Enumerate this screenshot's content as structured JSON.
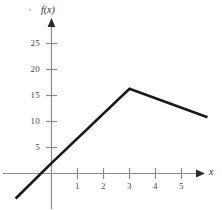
{
  "chart_data": {
    "type": "line",
    "title": "",
    "subtitle": "",
    "xlabel": "x",
    "ylabel": "f(x)",
    "xlim": [
      -1.4,
      6.3
    ],
    "ylim": [
      -1.5,
      29
    ],
    "grid": false,
    "legend": null,
    "x_ticks": [
      1,
      2,
      3,
      4,
      5
    ],
    "x_tick_labels": [
      "1",
      "2",
      "3",
      "4",
      "5"
    ],
    "y_ticks": [
      5,
      10,
      15,
      20,
      25
    ],
    "y_tick_labels": [
      "5",
      "10",
      "15",
      "20",
      "25"
    ],
    "series": [
      {
        "name": "f(x)",
        "x": [
          -1.38,
          0,
          3,
          6.0
        ],
        "values": [
          -4.8,
          2.0,
          16.3,
          10.8
        ],
        "color": "#1a1a1a",
        "linewidth": 2.6,
        "description": "piecewise linear: rising segment from lower left through y-intercept 2 to peak (3, 16.3), then falling to (6, 10.8)"
      }
    ],
    "annotations": [
      {
        "name": "peak-vertex",
        "x": 3,
        "y": 16.3
      },
      {
        "name": "y-intercept",
        "x": 0,
        "y": 2.0
      },
      {
        "name": "x-intercept",
        "x": -0.42,
        "y": 0
      }
    ],
    "axis_style": {
      "axis_color": "#8c8c8c",
      "arrow_color": "#2b2b2b",
      "tick_color": "#8c8c8c",
      "background": "#ffffff"
    }
  }
}
